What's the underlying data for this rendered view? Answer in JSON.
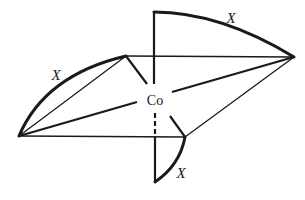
{
  "diagram": {
    "central_atom": {
      "label": "Co",
      "x": 155,
      "y": 100
    },
    "vertices": {
      "left": [
        19,
        136
      ],
      "upper_left": [
        126,
        56
      ],
      "top": [
        154,
        11
      ],
      "right": [
        294,
        57
      ],
      "lower_right": [
        185,
        137
      ],
      "bottom": [
        155,
        182
      ]
    },
    "ligand_labels": [
      {
        "label": "X",
        "x": 56,
        "y": 80,
        "chelate": "left to upper_left"
      },
      {
        "label": "X",
        "x": 231,
        "y": 23,
        "chelate": "top to right"
      },
      {
        "label": "X",
        "x": 181,
        "y": 178,
        "chelate": "lower_right to bottom"
      }
    ],
    "colors": {
      "stroke": "#1a1a1a",
      "background": "#ffffff"
    }
  }
}
